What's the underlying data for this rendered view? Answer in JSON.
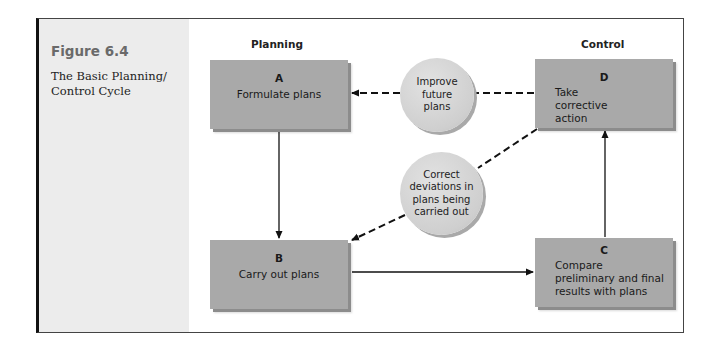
{
  "figure": {
    "number": "Figure 6.4",
    "title": "The Basic Planning/ Control Cycle"
  },
  "headings": {
    "planning": "Planning",
    "control": "Control"
  },
  "boxes": {
    "a": {
      "letter": "A",
      "text": "Formulate plans"
    },
    "b": {
      "letter": "B",
      "text": "Carry out plans"
    },
    "c": {
      "letter": "C",
      "text": "Compare preliminary and final results with plans"
    },
    "d": {
      "letter": "D",
      "text": "Take corrective action"
    }
  },
  "circles": {
    "improve": "Improve future plans",
    "correct": "Correct deviations in plans being carried out"
  },
  "flows": [
    {
      "from": "A",
      "to": "B",
      "style": "solid"
    },
    {
      "from": "B",
      "to": "C",
      "style": "solid"
    },
    {
      "from": "C",
      "to": "D",
      "style": "solid"
    },
    {
      "from": "D",
      "to": "A",
      "style": "dashed",
      "via": "Improve future plans"
    },
    {
      "from": "D",
      "to": "B",
      "style": "dashed",
      "via": "Correct deviations in plans being carried out"
    }
  ],
  "colors": {
    "box": "#a9a9a9",
    "circle": "#d4d4d4",
    "side_panel": "#ececec",
    "figure_number": "#6a6a6a"
  }
}
